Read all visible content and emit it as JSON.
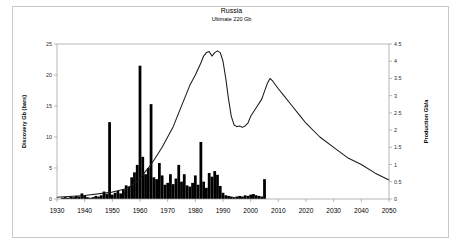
{
  "chart_data": {
    "type": "bar",
    "title": "Russia",
    "subtitle": "Ultimate  220 Gb",
    "xlabel": "",
    "ylabel": "Discovery Gb (bars)",
    "y2label": "Production Gb/a",
    "xlim": [
      1930,
      2050
    ],
    "ylim": [
      0,
      25
    ],
    "y2lim": [
      0,
      4.5
    ],
    "grid": false,
    "legend": "none",
    "xticks": [
      1930,
      1940,
      1950,
      1960,
      1970,
      1980,
      1990,
      2000,
      2010,
      2020,
      2030,
      2040,
      2050
    ],
    "yticks": [
      0,
      5,
      10,
      15,
      20,
      25
    ],
    "y2ticks": [
      0,
      0.5,
      1,
      1.5,
      2,
      2.5,
      3,
      3.5,
      4,
      4.5
    ],
    "series": [
      {
        "name": "Discovery Gb (bars)",
        "axis": "left",
        "type": "bar",
        "x": [
          1932,
          1933,
          1934,
          1935,
          1936,
          1937,
          1938,
          1939,
          1940,
          1941,
          1942,
          1943,
          1944,
          1945,
          1946,
          1947,
          1948,
          1949,
          1950,
          1951,
          1952,
          1953,
          1954,
          1955,
          1956,
          1957,
          1958,
          1959,
          1960,
          1961,
          1962,
          1963,
          1964,
          1965,
          1966,
          1967,
          1968,
          1969,
          1970,
          1971,
          1972,
          1973,
          1974,
          1975,
          1976,
          1977,
          1978,
          1979,
          1980,
          1981,
          1982,
          1983,
          1984,
          1985,
          1986,
          1987,
          1988,
          1989,
          1990,
          1991,
          1992,
          1993,
          1994,
          1995,
          1996,
          1997,
          1998,
          1999,
          2000,
          2001,
          2002,
          2003,
          2004,
          2005
        ],
        "values": [
          0.2,
          0.3,
          0.2,
          0.4,
          0.3,
          0.5,
          0.4,
          0.9,
          0.6,
          0.3,
          0.2,
          0.3,
          0.5,
          0.4,
          0.6,
          1.2,
          0.8,
          12.4,
          0.7,
          1.0,
          1.3,
          0.9,
          1.5,
          2.2,
          2.0,
          3.5,
          4.3,
          5.5,
          21.5,
          6.8,
          4.0,
          5.0,
          15.3,
          3.5,
          3.2,
          5.8,
          3.8,
          2.3,
          2.6,
          4.0,
          2.4,
          3.3,
          5.5,
          2.8,
          4.0,
          2.2,
          2.0,
          2.6,
          3.8,
          2.3,
          9.2,
          2.8,
          1.8,
          4.2,
          3.6,
          4.5,
          3.9,
          2.1,
          1.0,
          0.6,
          0.5,
          0.4,
          0.3,
          0.4,
          0.5,
          0.4,
          0.6,
          0.5,
          0.7,
          0.8,
          0.6,
          0.5,
          0.4,
          3.2
        ]
      },
      {
        "name": "Production Gb/a",
        "axis": "right",
        "type": "line",
        "x": [
          1930,
          1940,
          1950,
          1955,
          1958,
          1960,
          1962,
          1964,
          1966,
          1968,
          1970,
          1972,
          1974,
          1976,
          1978,
          1980,
          1982,
          1983,
          1984,
          1985,
          1986,
          1987,
          1988,
          1989,
          1990,
          1991,
          1992,
          1993,
          1994,
          1995,
          1996,
          1997,
          1998,
          1999,
          2000,
          2002,
          2004,
          2006,
          2007,
          2008,
          2010,
          2012,
          2015,
          2018,
          2020,
          2025,
          2030,
          2035,
          2040,
          2045,
          2050
        ],
        "values": [
          0.05,
          0.1,
          0.2,
          0.3,
          0.45,
          0.6,
          0.8,
          1.0,
          1.25,
          1.5,
          1.8,
          2.1,
          2.5,
          2.9,
          3.3,
          3.6,
          3.95,
          4.15,
          4.25,
          4.28,
          4.15,
          4.25,
          4.3,
          4.25,
          4.0,
          3.5,
          2.9,
          2.4,
          2.15,
          2.1,
          2.12,
          2.08,
          2.12,
          2.2,
          2.4,
          2.65,
          2.9,
          3.35,
          3.5,
          3.42,
          3.2,
          3.0,
          2.7,
          2.4,
          2.2,
          1.8,
          1.5,
          1.2,
          1.0,
          0.75,
          0.55
        ]
      }
    ]
  }
}
